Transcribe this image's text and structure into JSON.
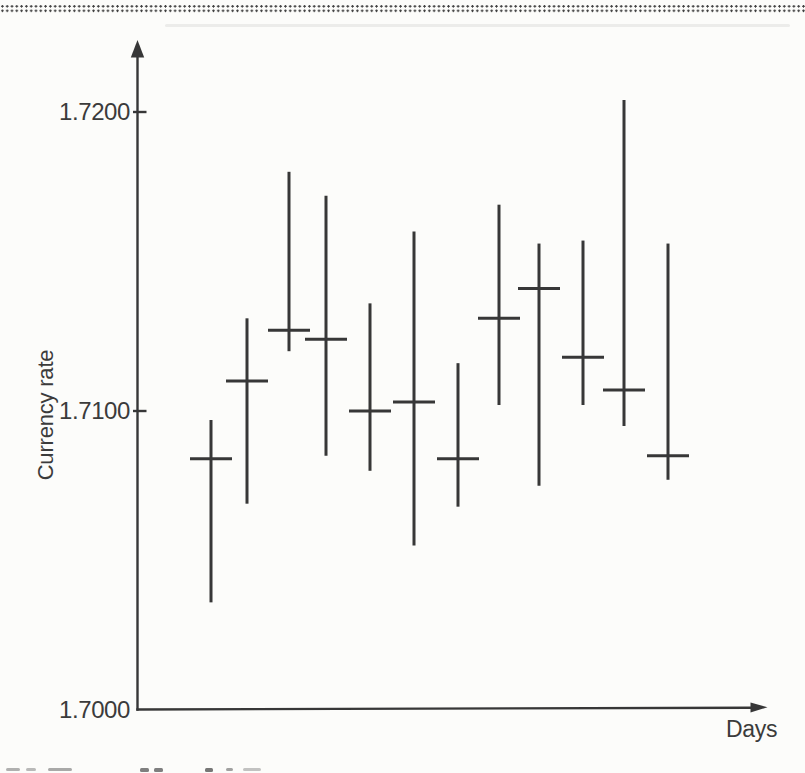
{
  "page": {
    "background": "#fcfcfa",
    "ink": "#373737",
    "label_color": "#3b3b3b"
  },
  "chart_data": {
    "type": "bar",
    "subtype": "high-low-close",
    "title": "",
    "xlabel": "Days",
    "ylabel": "Currency rate",
    "x": [
      1,
      2,
      3,
      4,
      5,
      6,
      7,
      8,
      9,
      10,
      11,
      12
    ],
    "ylim": [
      1.7,
      1.723
    ],
    "grid": false,
    "legend": false,
    "y_axis": {
      "ticks": [
        {
          "value": 1.7,
          "label": "1.7000"
        },
        {
          "value": 1.71,
          "label": "1.7100"
        },
        {
          "value": 1.72,
          "label": "1.7200"
        }
      ]
    },
    "bars": [
      {
        "day": 1,
        "high": 1.7097,
        "low": 1.7036,
        "close": 1.7084
      },
      {
        "day": 2,
        "high": 1.7131,
        "low": 1.7069,
        "close": 1.711
      },
      {
        "day": 3,
        "high": 1.718,
        "low": 1.712,
        "close": 1.7127
      },
      {
        "day": 4,
        "high": 1.7172,
        "low": 1.7085,
        "close": 1.7124
      },
      {
        "day": 5,
        "high": 1.7136,
        "low": 1.708,
        "close": 1.71
      },
      {
        "day": 6,
        "high": 1.716,
        "low": 1.7055,
        "close": 1.7103
      },
      {
        "day": 7,
        "high": 1.7116,
        "low": 1.7068,
        "close": 1.7084
      },
      {
        "day": 8,
        "high": 1.7169,
        "low": 1.7102,
        "close": 1.7131
      },
      {
        "day": 9,
        "high": 1.7156,
        "low": 1.7075,
        "close": 1.7141
      },
      {
        "day": 10,
        "high": 1.7157,
        "low": 1.7102,
        "close": 1.7118
      },
      {
        "day": 11,
        "high": 1.7204,
        "low": 1.7095,
        "close": 1.7107
      },
      {
        "day": 12,
        "high": 1.7156,
        "low": 1.7077,
        "close": 1.7085
      }
    ]
  }
}
